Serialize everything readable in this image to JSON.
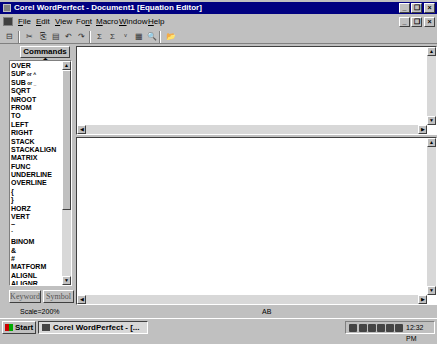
{
  "window": {
    "title": "Corel WordPerfect - Document1 [Equation Editor]",
    "controls": {
      "minimize": "_",
      "restore": "❐",
      "close": "×"
    },
    "doc_controls": {
      "minimize": "_",
      "restore": "❐",
      "close": "×"
    }
  },
  "menu": {
    "items": [
      {
        "label": "File",
        "u": "F",
        "rest": "ile"
      },
      {
        "label": "Edit",
        "u": "E",
        "rest": "dit"
      },
      {
        "label": "View",
        "u": "V",
        "rest": "iew"
      },
      {
        "label": "Font",
        "pre": "Fo",
        "u": "n",
        "rest": "t"
      },
      {
        "label": "Macro",
        "u": "M",
        "rest": "acro"
      },
      {
        "label": "Window",
        "u": "W",
        "rest": "indow"
      },
      {
        "label": "Help",
        "u": "H",
        "rest": "elp"
      }
    ]
  },
  "toolbar": {
    "buttons": [
      {
        "name": "close-editor-icon",
        "glyph": "⊟"
      },
      {
        "name": "cut-icon",
        "glyph": "✂"
      },
      {
        "name": "copy-icon",
        "glyph": "⎘"
      },
      {
        "name": "paste-icon",
        "glyph": "▤"
      },
      {
        "name": "undo-icon",
        "glyph": "↶"
      },
      {
        "name": "redo-icon",
        "glyph": "↷"
      },
      {
        "name": "redisplay-icon",
        "glyph": "Σ"
      },
      {
        "name": "zoom-display-icon",
        "glyph": "Σ"
      },
      {
        "name": "insert-symbol-icon",
        "glyph": "ᵛ"
      },
      {
        "name": "settings-icon",
        "glyph": "▦"
      },
      {
        "name": "zoom-icon",
        "glyph": "🔍"
      },
      {
        "name": "open-icon",
        "glyph": "📂"
      }
    ]
  },
  "palette": {
    "dropdown_label": "Commands ⬍",
    "commands": [
      {
        "label": "OVER"
      },
      {
        "label": "SUP",
        "suffix": " or ^"
      },
      {
        "label": "SUB",
        "suffix": " or _"
      },
      {
        "label": "SQRT"
      },
      {
        "label": "NROOT"
      },
      {
        "label": "FROM"
      },
      {
        "label": "TO"
      },
      {
        "label": "LEFT"
      },
      {
        "label": "RIGHT"
      },
      {
        "label": "STACK"
      },
      {
        "label": "STACKALIGN"
      },
      {
        "label": "MATRIX"
      },
      {
        "label": "FUNC"
      },
      {
        "label": "UNDERLINE"
      },
      {
        "label": "OVERLINE"
      },
      {
        "label": "{"
      },
      {
        "label": "}"
      },
      {
        "label": "HORZ"
      },
      {
        "label": "VERT"
      },
      {
        "label": "~"
      },
      {
        "label": "`"
      },
      {
        "label": "BINOM"
      },
      {
        "label": "&"
      },
      {
        "label": "#"
      },
      {
        "label": "MATFORM"
      },
      {
        "label": "ALIGNL"
      },
      {
        "label": "ALIGNR"
      }
    ],
    "keyword_button": "Keyword",
    "symbol_button": "Symbol"
  },
  "editor": {
    "top_pane_text": "",
    "bottom_pane_text": ""
  },
  "status": {
    "scale": "Scale=200%",
    "mode": "AB"
  },
  "taskbar": {
    "start_label": "Start",
    "task_label": "Corel WordPerfect - [...",
    "clock": "12:32 PM"
  }
}
